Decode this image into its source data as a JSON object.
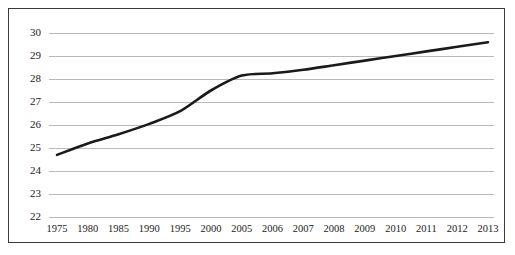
{
  "figure": {
    "background_color": "#ffffff",
    "frame_color": "#3a3a3a",
    "grid_color": "#b9b9b9",
    "line_color": "#1a1a1a"
  },
  "chart_data": {
    "type": "line",
    "title": "",
    "subtitle": "",
    "xlabel": "",
    "ylabel": "",
    "legend": [],
    "legend_position": "none",
    "grid": true,
    "grid_axis": "y",
    "axis_scale": "categorical",
    "ylim": [
      22,
      30
    ],
    "ytick_labels": [
      "22",
      "23",
      "24",
      "25",
      "26",
      "27",
      "28",
      "29",
      "30"
    ],
    "yticks": [
      22,
      23,
      24,
      25,
      26,
      27,
      28,
      29,
      30
    ],
    "categories": [
      "1975",
      "1980",
      "1985",
      "1990",
      "1995",
      "2000",
      "2005",
      "2006",
      "2007",
      "2008",
      "2009",
      "2010",
      "2011",
      "2012",
      "2013"
    ],
    "series": [
      {
        "name": "series-1",
        "color": "#1a1a1a",
        "values": [
          24.7,
          25.2,
          25.6,
          26.05,
          26.6,
          27.5,
          28.15,
          28.25,
          28.4,
          28.6,
          28.8,
          29.0,
          29.2,
          29.4,
          29.6
        ]
      }
    ],
    "annotations": []
  }
}
